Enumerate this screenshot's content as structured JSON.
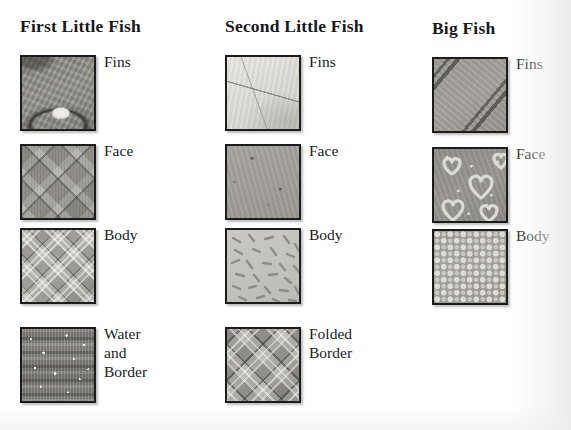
{
  "page": {
    "background_color": "#ffffff",
    "text_color": "#1a1a1a"
  },
  "columns": [
    {
      "title": "First Little Fish",
      "swatches": [
        {
          "label": "Fins",
          "pattern": "mottled-grey-with-oval-highlight"
        },
        {
          "label": "Face",
          "pattern": "large-diamond-plaid"
        },
        {
          "label": "Body",
          "pattern": "fine-diagonal-tartan"
        },
        {
          "label": "Water and\nBorder",
          "pattern": "horizontal-ribbed-speckle"
        }
      ]
    },
    {
      "title": "Second Little Fish",
      "swatches": [
        {
          "label": "Fins",
          "pattern": "pale-crease-line"
        },
        {
          "label": "Face",
          "pattern": "flat-grey-flecks"
        },
        {
          "label": "Body",
          "pattern": "scattered-dashes"
        },
        {
          "label": "Folded\nBorder",
          "pattern": "diagonal-tartan-plaid"
        }
      ]
    },
    {
      "title": "Big Fish",
      "swatches": [
        {
          "label": "Fins",
          "pattern": "wide-diagonal-bands"
        },
        {
          "label": "Face",
          "pattern": "outlined-hearts-and-dots"
        },
        {
          "label": "Body",
          "pattern": "dense-polka-dots"
        }
      ]
    }
  ]
}
